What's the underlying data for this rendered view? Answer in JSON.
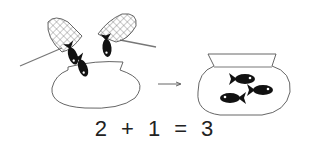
{
  "illustration": {
    "left_scene": "two nets each holding a fish, dropping into a bowl containing one fish",
    "right_scene": "bowl containing three fish",
    "arrow": "right-arrow"
  },
  "equation": {
    "a": "2",
    "op": "+",
    "b": "1",
    "eq": "=",
    "result": "3"
  },
  "colors": {
    "line": "#555555",
    "fish": "#111111",
    "background": "#ffffff"
  }
}
